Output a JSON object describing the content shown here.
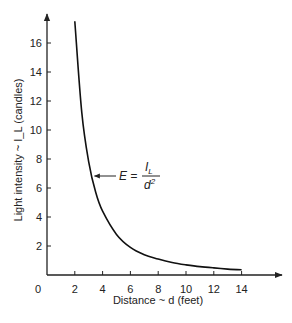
{
  "chart_data": {
    "type": "line",
    "title": "",
    "xlabel": "Distance ~ d (feet)",
    "ylabel": "Light intensity ~ I_L (candles)",
    "xlim": [
      0,
      16.5
    ],
    "ylim": [
      0,
      18
    ],
    "xticks": [
      2,
      4,
      6,
      8,
      10,
      12,
      14
    ],
    "xtick_labels": [
      "2",
      "4",
      "6",
      "8",
      "10",
      "12",
      "14"
    ],
    "yticks": [
      2,
      4,
      6,
      8,
      10,
      12,
      14,
      16
    ],
    "ytick_labels": [
      "2",
      "4",
      "6",
      "8",
      "10",
      "12",
      "14",
      "16"
    ],
    "origin_label": "0",
    "grid": false,
    "series": [
      {
        "name": "E = I_L / d^2",
        "x": [
          2,
          2.5,
          3,
          3.5,
          4,
          5,
          6,
          7,
          8,
          9,
          10,
          11,
          12,
          13,
          14
        ],
        "y": [
          17.5,
          11.2,
          7.8,
          5.7,
          4.4,
          2.8,
          1.9,
          1.4,
          1.1,
          0.86,
          0.7,
          0.58,
          0.49,
          0.41,
          0.36
        ]
      }
    ],
    "annotation": {
      "text_lhs": "E =",
      "numerator": "I",
      "numerator_sub": "L",
      "denominator": "d",
      "denominator_sup": "2",
      "points_to": {
        "x": 3.2,
        "y": 6.8
      }
    }
  }
}
